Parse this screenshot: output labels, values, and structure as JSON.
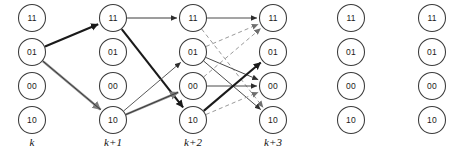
{
  "diagram": {
    "type": "trellis",
    "geometry": {
      "width": 463,
      "height": 158,
      "node_radius": 13.5,
      "column_x": [
        32,
        113,
        193,
        273,
        351,
        432
      ],
      "row_y": [
        18,
        52,
        86,
        120
      ],
      "stage_label_y": 146
    },
    "node_states": [
      "11",
      "01",
      "00",
      "10"
    ],
    "columns": [
      {
        "index": 0,
        "stage_label": "k",
        "x": 32,
        "nodes": [
          {
            "state": "11",
            "row": 0
          },
          {
            "state": "01",
            "row": 1
          },
          {
            "state": "00",
            "row": 2
          },
          {
            "state": "10",
            "row": 3
          }
        ]
      },
      {
        "index": 1,
        "stage_label": "k+1",
        "x": 113,
        "nodes": [
          {
            "state": "11",
            "row": 0
          },
          {
            "state": "01",
            "row": 1
          },
          {
            "state": "00",
            "row": 2
          },
          {
            "state": "10",
            "row": 3
          }
        ]
      },
      {
        "index": 2,
        "stage_label": "k+2",
        "x": 193,
        "nodes": [
          {
            "state": "11",
            "row": 0
          },
          {
            "state": "01",
            "row": 1
          },
          {
            "state": "00",
            "row": 2
          },
          {
            "state": "10",
            "row": 3
          }
        ]
      },
      {
        "index": 3,
        "stage_label": "k+3",
        "x": 273,
        "nodes": [
          {
            "state": "11",
            "row": 0
          },
          {
            "state": "01",
            "row": 1
          },
          {
            "state": "00",
            "row": 2
          },
          {
            "state": "10",
            "row": 3
          }
        ]
      },
      {
        "index": 4,
        "stage_label": "",
        "x": 351,
        "nodes": [
          {
            "state": "11",
            "row": 0
          },
          {
            "state": "01",
            "row": 1
          },
          {
            "state": "00",
            "row": 2
          },
          {
            "state": "10",
            "row": 3
          }
        ]
      },
      {
        "index": 5,
        "stage_label": "",
        "x": 432,
        "nodes": [
          {
            "state": "11",
            "row": 0
          },
          {
            "state": "01",
            "row": 1
          },
          {
            "state": "00",
            "row": 2
          },
          {
            "state": "10",
            "row": 3
          }
        ]
      }
    ],
    "edges": [
      {
        "from": [
          0,
          1
        ],
        "to": [
          1,
          0
        ],
        "style": "thick-solid",
        "color": "#1a1a1a",
        "width": 2.1,
        "dash": "none"
      },
      {
        "from": [
          0,
          1
        ],
        "to": [
          1,
          3
        ],
        "style": "thick-solid-gray",
        "color": "#8a8a8a",
        "width": 2.4,
        "dash": "none"
      },
      {
        "from": [
          0,
          1
        ],
        "to": [
          1,
          3
        ],
        "style": "thin-solid-overlay",
        "color": "#2a2a2a",
        "width": 0.85,
        "dash": "none"
      },
      {
        "from": [
          1,
          0
        ],
        "to": [
          2,
          0
        ],
        "style": "thin-solid",
        "color": "#3a3a3a",
        "width": 1.0,
        "dash": "none"
      },
      {
        "from": [
          1,
          0
        ],
        "to": [
          2,
          3
        ],
        "style": "thick-solid",
        "color": "#1a1a1a",
        "width": 2.1,
        "dash": "none"
      },
      {
        "from": [
          1,
          3
        ],
        "to": [
          2,
          1
        ],
        "style": "thin-solid",
        "color": "#5a5a5a",
        "width": 1.0,
        "dash": "none"
      },
      {
        "from": [
          1,
          3
        ],
        "to": [
          2,
          2
        ],
        "style": "thick-solid-gray",
        "color": "#8a8a8a",
        "width": 2.4,
        "dash": "none"
      },
      {
        "from": [
          1,
          3
        ],
        "to": [
          2,
          2
        ],
        "style": "thin-solid-overlay",
        "color": "#2a2a2a",
        "width": 0.85,
        "dash": "none"
      },
      {
        "from": [
          2,
          0
        ],
        "to": [
          3,
          0
        ],
        "style": "thin-solid",
        "color": "#4a4a4a",
        "width": 1.0,
        "dash": "none"
      },
      {
        "from": [
          2,
          0
        ],
        "to": [
          3,
          3
        ],
        "style": "dashed-gray",
        "color": "#9a9a9a",
        "width": 1.0,
        "dash": "4,3"
      },
      {
        "from": [
          2,
          1
        ],
        "to": [
          3,
          0
        ],
        "style": "dashed-gray",
        "color": "#9a9a9a",
        "width": 1.0,
        "dash": "4,3"
      },
      {
        "from": [
          2,
          1
        ],
        "to": [
          3,
          2
        ],
        "style": "thin-solid",
        "color": "#4a4a4a",
        "width": 1.0,
        "dash": "none"
      },
      {
        "from": [
          2,
          1
        ],
        "to": [
          3,
          3
        ],
        "style": "thin-solid",
        "color": "#4a4a4a",
        "width": 1.0,
        "dash": "none"
      },
      {
        "from": [
          2,
          2
        ],
        "to": [
          3,
          2
        ],
        "style": "thin-solid",
        "color": "#4a4a4a",
        "width": 1.0,
        "dash": "none"
      },
      {
        "from": [
          2,
          2
        ],
        "to": [
          3,
          0
        ],
        "style": "dashed-gray",
        "color": "#9a9a9a",
        "width": 1.0,
        "dash": "4,3"
      },
      {
        "from": [
          2,
          3
        ],
        "to": [
          3,
          1
        ],
        "style": "thick-solid",
        "color": "#1a1a1a",
        "width": 2.1,
        "dash": "none"
      },
      {
        "from": [
          2,
          3
        ],
        "to": [
          3,
          2
        ],
        "style": "dashed-gray",
        "color": "#9a9a9a",
        "width": 1.0,
        "dash": "4,3"
      }
    ]
  }
}
